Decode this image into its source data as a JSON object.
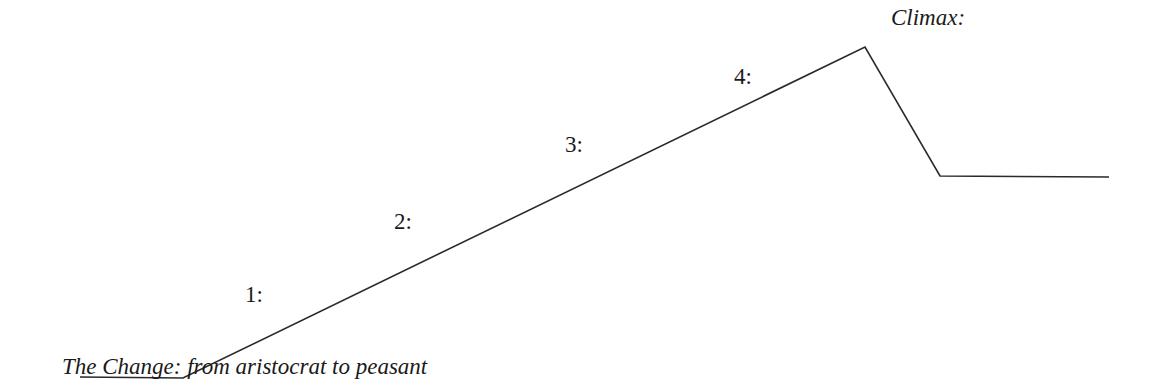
{
  "diagram": {
    "type": "plot-diagram",
    "line_color": "#2a2a2a",
    "path_points": [
      [
        80,
        377
      ],
      [
        183,
        378
      ],
      [
        865,
        47
      ],
      [
        940,
        176
      ],
      [
        1109,
        177
      ]
    ],
    "labels": {
      "change": "The Change: from aristocrat to peasant",
      "step1": "1:",
      "step2": "2:",
      "step3": "3:",
      "step4": "4:",
      "climax": "Climax:"
    }
  }
}
